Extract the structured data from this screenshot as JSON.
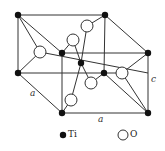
{
  "diagram": {
    "title": "",
    "labels": {
      "a_left": "a",
      "a_bottom": "a",
      "c": "c"
    },
    "legend": [
      {
        "symbol": "filled-circle",
        "label": "Ti"
      },
      {
        "symbol": "open-circle",
        "label": "O"
      }
    ],
    "colors": {
      "line": "#333333",
      "ti": "#111111",
      "o_fill": "#ffffff"
    }
  }
}
